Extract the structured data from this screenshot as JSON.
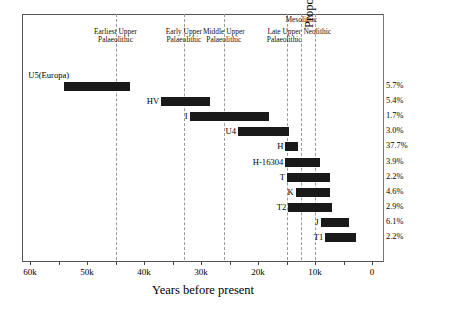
{
  "chart_data": {
    "type": "bar",
    "orientation": "horizontal-range",
    "title": "",
    "xlabel": "Years before present",
    "ylabel": "Proportion of European lineages today",
    "xlim": [
      60000,
      0
    ],
    "xticks": [
      60000,
      55000,
      50000,
      45000,
      40000,
      35000,
      30000,
      25000,
      20000,
      15000,
      10000,
      5000,
      0
    ],
    "xtick_labels": [
      "60k",
      "",
      "50k",
      "",
      "40k",
      "",
      "30k",
      "",
      "20k",
      "",
      "10k",
      "",
      "0"
    ],
    "grid": "vertical-dashed-at-period-boundaries",
    "legend": "none",
    "categories": [
      "U5(Europa)",
      "HV",
      "I",
      "U4",
      "H",
      "H-16304",
      "T",
      "K",
      "T2",
      "J",
      "T1"
    ],
    "series": [
      {
        "name": "Age range of mtDNA haplogroup founder",
        "units": "years before present",
        "ranges": [
          {
            "label": "U5(Europa)",
            "start": 54000,
            "end": 42500,
            "percent": "5.7%"
          },
          {
            "label": "HV",
            "start": 37000,
            "end": 28500,
            "percent": "5.4%"
          },
          {
            "label": "I",
            "start": 32000,
            "end": 18000,
            "percent": "1.7%"
          },
          {
            "label": "U4",
            "start": 23500,
            "end": 14500,
            "percent": "3.0%"
          },
          {
            "label": "H",
            "start": 15200,
            "end": 13000,
            "percent": "37.7%"
          },
          {
            "label": "H-16304",
            "start": 15200,
            "end": 9200,
            "percent": "3.9%"
          },
          {
            "label": "T",
            "start": 14900,
            "end": 7400,
            "percent": "2.2%"
          },
          {
            "label": "K",
            "start": 13400,
            "end": 7400,
            "percent": "4.6%"
          },
          {
            "label": "T2",
            "start": 14700,
            "end": 7100,
            "percent": "2.9%"
          },
          {
            "label": "J",
            "start": 9000,
            "end": 4000,
            "percent": "6.1%"
          },
          {
            "label": "T1",
            "start": 8200,
            "end": 2800,
            "percent": "2.2%"
          }
        ]
      }
    ],
    "percent_column_header": "Proportion of European lineages today",
    "percent_values": [
      "5.7%",
      "5.4%",
      "1.7%",
      "3.0%",
      "37.7%",
      "3.9%",
      "2.2%",
      "4.6%",
      "2.9%",
      "6.1%",
      "2.2%"
    ],
    "period_markers": [
      {
        "name": "Earliest Upper Palaeolithic",
        "label": "Earliest Upper\nPalaeolithic",
        "x": 45000,
        "label_x": 45000
      },
      {
        "name": "Early Upper Palaeolithic",
        "label": "Early Upper\nPalaeolithic",
        "x": 33000,
        "label_x": 33000
      },
      {
        "name": "Middle Upper Palaeolithic",
        "label": "Middle Upper\nPalaeolithic",
        "x": 26000,
        "label_x": 26000
      },
      {
        "name": "Late Upper Palaeolithic",
        "label": "Late Upper\nPalaeolithic",
        "x": 15000,
        "label_x": 15400
      },
      {
        "name": "Mesolithic",
        "label": "Mesolithic",
        "x": 12400,
        "label_x": 12400
      },
      {
        "name": "Neolithic",
        "label": "Neolithic",
        "x": 10000,
        "label_x": 9600
      }
    ],
    "bar_color": "#1a1a1a",
    "gridline_color": "#9a9a9a",
    "frame_color": "#555555"
  }
}
